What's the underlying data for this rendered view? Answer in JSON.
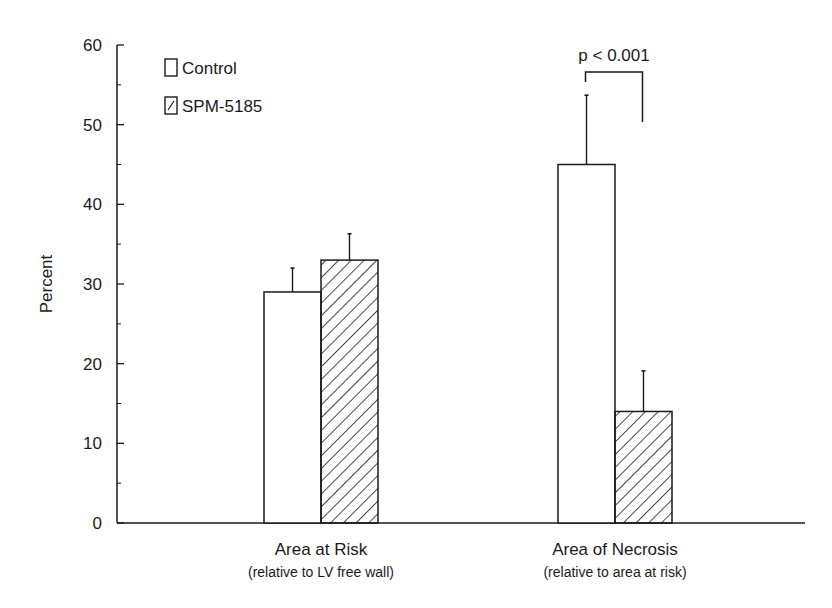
{
  "chart_data": {
    "type": "bar",
    "title": "",
    "xlabel": "",
    "ylabel": "Percent",
    "ylim": [
      0,
      60
    ],
    "yticks": [
      0,
      10,
      20,
      30,
      40,
      50,
      60
    ],
    "grid": false,
    "legend_position": "top-left",
    "categories": [
      {
        "label": "Area at Risk",
        "sublabel": "(relative to LV free wall)"
      },
      {
        "label": "Area of Necrosis",
        "sublabel": "(relative to area at risk)"
      }
    ],
    "series": [
      {
        "name": "Control",
        "fill": "open",
        "values": [
          29,
          45
        ],
        "error_upper": [
          32,
          53.7
        ]
      },
      {
        "name": "SPM-5185",
        "fill": "hatched",
        "values": [
          33,
          14
        ],
        "error_upper": [
          36.3,
          19.1
        ]
      }
    ],
    "annotations": [
      {
        "text": "p < 0.001",
        "category": "Area of Necrosis",
        "type": "significance-bracket"
      }
    ]
  },
  "labels": {
    "ylabel": "Percent",
    "legend": [
      "Control",
      "SPM-5185"
    ],
    "annotation": "p < 0.001"
  },
  "colors": {
    "ink": "#1a1a1a",
    "background": "#ffffff"
  }
}
